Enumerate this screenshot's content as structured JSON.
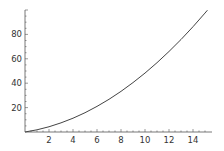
{
  "chart_data": {
    "type": "line",
    "title": "",
    "xlabel": "",
    "ylabel": "",
    "xlim": [
      0,
      15.3
    ],
    "ylim": [
      0,
      100
    ],
    "grid": false,
    "legend": null,
    "x_ticks": [
      "2",
      "4",
      "6",
      "8",
      "10",
      "12",
      "14"
    ],
    "y_ticks": [
      "20",
      "40",
      "60",
      "80"
    ],
    "series": [
      {
        "name": "curve",
        "color": "#444444",
        "x": [
          0,
          1,
          2,
          3,
          4,
          5,
          6,
          7,
          8,
          9,
          10,
          11,
          12,
          13,
          14,
          15,
          15.2
        ],
        "y": [
          0,
          1.8,
          4.3,
          7.5,
          11.3,
          15.8,
          21,
          26.8,
          33.3,
          40.5,
          48.3,
          56.8,
          66,
          75.8,
          86.3,
          97.5,
          99.8
        ]
      }
    ]
  },
  "colors": {
    "axis": "#555555",
    "line": "#444444",
    "background": "#ffffff"
  }
}
